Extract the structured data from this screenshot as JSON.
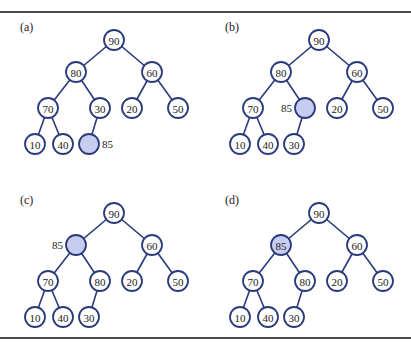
{
  "figure": {
    "node_radius": 10,
    "colors": {
      "edge": "#2b3a7a",
      "node_fill": "#ffffff",
      "highlight_fill": "#c8cdf0",
      "text": "#222222",
      "rule": "#4a4a4a"
    }
  },
  "panels": [
    {
      "label": "(a)",
      "origin": [
        0,
        0
      ],
      "nodes": [
        {
          "id": "n0",
          "text": "90",
          "x": 114,
          "y": 40
        },
        {
          "id": "n1",
          "text": "80",
          "x": 76,
          "y": 72
        },
        {
          "id": "n2",
          "text": "60",
          "x": 152,
          "y": 72
        },
        {
          "id": "n3",
          "text": "70",
          "x": 48,
          "y": 108
        },
        {
          "id": "n4",
          "text": "30",
          "x": 100,
          "y": 108
        },
        {
          "id": "n5",
          "text": "20",
          "x": 132,
          "y": 108
        },
        {
          "id": "n6",
          "text": "50",
          "x": 178,
          "y": 108
        },
        {
          "id": "n7",
          "text": "10",
          "x": 35,
          "y": 144
        },
        {
          "id": "n8",
          "text": "40",
          "x": 63,
          "y": 144
        },
        {
          "id": "n9",
          "text": "",
          "x": 89,
          "y": 144,
          "highlight": true,
          "side_label": "85",
          "side": "right"
        }
      ]
    },
    {
      "label": "(b)",
      "origin": [
        205,
        0
      ],
      "nodes": [
        {
          "id": "n0",
          "text": "90",
          "x": 114,
          "y": 40
        },
        {
          "id": "n1",
          "text": "80",
          "x": 76,
          "y": 72
        },
        {
          "id": "n2",
          "text": "60",
          "x": 152,
          "y": 72
        },
        {
          "id": "n3",
          "text": "70",
          "x": 48,
          "y": 108
        },
        {
          "id": "n4",
          "text": "",
          "x": 100,
          "y": 108,
          "highlight": true,
          "side_label": "85",
          "side": "left"
        },
        {
          "id": "n5",
          "text": "20",
          "x": 132,
          "y": 108
        },
        {
          "id": "n6",
          "text": "50",
          "x": 178,
          "y": 108
        },
        {
          "id": "n7",
          "text": "10",
          "x": 35,
          "y": 144
        },
        {
          "id": "n8",
          "text": "40",
          "x": 63,
          "y": 144
        },
        {
          "id": "n9",
          "text": "30",
          "x": 89,
          "y": 144
        }
      ]
    },
    {
      "label": "(c)",
      "origin": [
        0,
        173
      ],
      "nodes": [
        {
          "id": "n0",
          "text": "90",
          "x": 114,
          "y": 40
        },
        {
          "id": "n1",
          "text": "",
          "x": 76,
          "y": 72,
          "highlight": true,
          "side_label": "85",
          "side": "left"
        },
        {
          "id": "n2",
          "text": "60",
          "x": 152,
          "y": 72
        },
        {
          "id": "n3",
          "text": "70",
          "x": 48,
          "y": 108
        },
        {
          "id": "n4",
          "text": "80",
          "x": 100,
          "y": 108
        },
        {
          "id": "n5",
          "text": "20",
          "x": 132,
          "y": 108
        },
        {
          "id": "n6",
          "text": "50",
          "x": 178,
          "y": 108
        },
        {
          "id": "n7",
          "text": "10",
          "x": 35,
          "y": 144
        },
        {
          "id": "n8",
          "text": "40",
          "x": 63,
          "y": 144
        },
        {
          "id": "n9",
          "text": "30",
          "x": 89,
          "y": 144
        }
      ]
    },
    {
      "label": "(d)",
      "origin": [
        205,
        173
      ],
      "nodes": [
        {
          "id": "n0",
          "text": "90",
          "x": 114,
          "y": 40
        },
        {
          "id": "n1",
          "text": "85",
          "x": 76,
          "y": 72,
          "highlight": true
        },
        {
          "id": "n2",
          "text": "60",
          "x": 152,
          "y": 72
        },
        {
          "id": "n3",
          "text": "70",
          "x": 48,
          "y": 108
        },
        {
          "id": "n4",
          "text": "80",
          "x": 100,
          "y": 108
        },
        {
          "id": "n5",
          "text": "20",
          "x": 132,
          "y": 108
        },
        {
          "id": "n6",
          "text": "50",
          "x": 178,
          "y": 108
        },
        {
          "id": "n7",
          "text": "10",
          "x": 35,
          "y": 144
        },
        {
          "id": "n8",
          "text": "40",
          "x": 63,
          "y": 144
        },
        {
          "id": "n9",
          "text": "30",
          "x": 89,
          "y": 144
        }
      ]
    }
  ],
  "edges": [
    [
      "n0",
      "n1"
    ],
    [
      "n0",
      "n2"
    ],
    [
      "n1",
      "n3"
    ],
    [
      "n1",
      "n4"
    ],
    [
      "n2",
      "n5"
    ],
    [
      "n2",
      "n6"
    ],
    [
      "n3",
      "n7"
    ],
    [
      "n3",
      "n8"
    ],
    [
      "n4",
      "n9"
    ]
  ]
}
